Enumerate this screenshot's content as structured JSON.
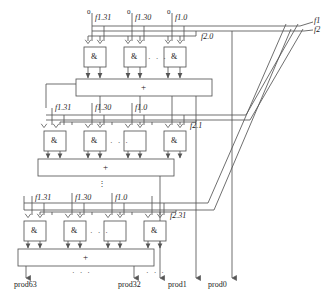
{
  "diagram": {
    "stroke_color": "#555555",
    "text_color": "#1a1a1a"
  },
  "rows": [
    {
      "id": "row0",
      "zero_labels": [
        "0",
        "0",
        "0"
      ],
      "f_labels": [
        "f1.31",
        "f1.30",
        "f1.0"
      ],
      "gate_labels": [
        "&",
        "&",
        "&"
      ],
      "gate_ellipsis": "· · ·",
      "control_label": "f2.0",
      "adder_label": "+"
    },
    {
      "id": "row1",
      "zero_labels": [
        "",
        "",
        ""
      ],
      "f_labels": [
        "f1.31",
        "f1.30",
        "f1.0"
      ],
      "gate_labels": [
        "&",
        "&",
        "&"
      ],
      "gate_ellipsis": "· · ·",
      "control_label": "f2.1",
      "adder_label": "+"
    },
    {
      "id": "row2",
      "zero_labels": [
        "",
        "",
        ""
      ],
      "f_labels": [
        "f1.31",
        "f1.30",
        "f1.0"
      ],
      "gate_labels": [
        "&",
        "&",
        "&"
      ],
      "gate_ellipsis": "· · ·",
      "control_label": "f2.31",
      "adder_label": "+"
    }
  ],
  "vertical_ellipsis": "⋮",
  "bus_labels": {
    "f1": "f1",
    "f2": "f2"
  },
  "outputs": {
    "prod63": "prod63",
    "prod32": "prod32",
    "prod1": "prod1",
    "prod0": "prod0",
    "ellipsis_left": "· · ·",
    "ellipsis_right": "· · ·"
  }
}
